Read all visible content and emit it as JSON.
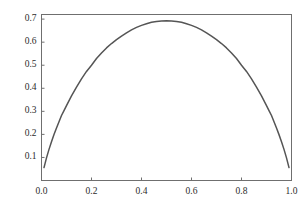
{
  "chart_data": {
    "type": "line",
    "title": "",
    "subtitle": "",
    "xlabel": "",
    "ylabel": "",
    "xlim": [
      0.0,
      1.0
    ],
    "ylim": [
      0.0,
      0.72
    ],
    "grid": false,
    "legend": null,
    "legend_position": "none",
    "annotations": [],
    "xtick_labels": [
      "0.0",
      "0.2",
      "0.4",
      "0.6",
      "0.8",
      "1.0"
    ],
    "xtick_values": [
      0.0,
      0.2,
      0.4,
      0.6,
      0.8,
      1.0
    ],
    "ytick_labels": [
      "0.1",
      "0.2",
      "0.3",
      "0.4",
      "0.5",
      "0.6",
      "0.7"
    ],
    "ytick_values": [
      0.1,
      0.2,
      0.3,
      0.4,
      0.5,
      0.6,
      0.7
    ],
    "series": [
      {
        "name": "binary entropy",
        "color": "#555555",
        "linewidth": 1.5,
        "x": [
          0.01,
          0.02,
          0.03,
          0.04,
          0.05,
          0.06,
          0.07,
          0.08,
          0.09,
          0.1,
          0.12,
          0.14,
          0.16,
          0.18,
          0.2,
          0.22,
          0.24,
          0.26,
          0.28,
          0.3,
          0.32,
          0.34,
          0.36,
          0.38,
          0.4,
          0.42,
          0.44,
          0.46,
          0.48,
          0.5,
          0.52,
          0.54,
          0.56,
          0.58,
          0.6,
          0.62,
          0.64,
          0.66,
          0.68,
          0.7,
          0.72,
          0.74,
          0.76,
          0.78,
          0.8,
          0.82,
          0.84,
          0.86,
          0.88,
          0.9,
          0.91,
          0.92,
          0.93,
          0.94,
          0.95,
          0.96,
          0.97,
          0.98,
          0.99
        ],
        "y": [
          0.056,
          0.098,
          0.135,
          0.168,
          0.199,
          0.228,
          0.255,
          0.282,
          0.303,
          0.325,
          0.367,
          0.405,
          0.441,
          0.473,
          0.5,
          0.529,
          0.553,
          0.575,
          0.594,
          0.611,
          0.626,
          0.64,
          0.653,
          0.664,
          0.673,
          0.68,
          0.686,
          0.69,
          0.692,
          0.693,
          0.692,
          0.69,
          0.686,
          0.68,
          0.673,
          0.664,
          0.653,
          0.64,
          0.626,
          0.611,
          0.594,
          0.575,
          0.553,
          0.529,
          0.5,
          0.473,
          0.441,
          0.405,
          0.367,
          0.325,
          0.303,
          0.282,
          0.255,
          0.228,
          0.199,
          0.168,
          0.135,
          0.098,
          0.056
        ]
      }
    ]
  },
  "style": {
    "background": "#ffffff",
    "frame_color": "#6f6f6f",
    "tick_color": "#6f6f6f",
    "tick_text_color": "#2b2b2b"
  }
}
